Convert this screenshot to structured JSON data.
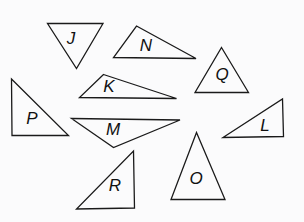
{
  "figure": {
    "background_color": "#fbfbfc",
    "stroke_color": "#1a1a1a",
    "label_color": "#111111",
    "width": 304,
    "height": 222,
    "triangles": [
      {
        "label": "J",
        "points": "47.5,23.5 103,23.5 76.5,68.5",
        "label_x": 71,
        "label_y": 40
      },
      {
        "label": "N",
        "points": "136.5,26 196,58.5 113.5,57.5",
        "label_x": 146,
        "label_y": 47
      },
      {
        "label": "Q",
        "points": "221.5,47.5 248.5,92.5 195,92.5",
        "label_x": 222,
        "label_y": 76
      },
      {
        "label": "K",
        "points": "103.5,74.5 176.5,98.5 79.5,97.5",
        "label_x": 109,
        "label_y": 88
      },
      {
        "label": "P",
        "points": "11.5,79 68.5,135.5 12,135.5",
        "label_x": 32,
        "label_y": 120
      },
      {
        "label": "M",
        "points": "71.5,118.5 180,120 113.5,147.5",
        "label_x": 113,
        "label_y": 131
      },
      {
        "label": "L",
        "points": "282.5,99 283.5,136.5 223,137.5",
        "label_x": 265,
        "label_y": 127
      },
      {
        "label": "R",
        "points": "133.5,151 134.5,208 76.5,209",
        "label_x": 115,
        "label_y": 187
      },
      {
        "label": "O",
        "points": "196.5,132.5 225,199.5 171,199.5",
        "label_x": 196,
        "label_y": 180
      }
    ]
  }
}
